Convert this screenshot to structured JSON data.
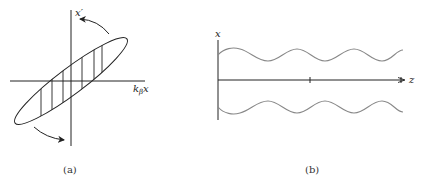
{
  "panel_a": {
    "caption": "(a)",
    "y_axis_label": "x′",
    "x_axis_label_main": "k",
    "x_axis_label_sub": "β",
    "x_axis_label_var": "x",
    "description": "Tilted phase-space ellipse with vertical hatching and rotation arrows"
  },
  "panel_b": {
    "caption": "(b)",
    "y_axis_label": "x",
    "x_axis_label": "z",
    "description": "Beam envelope oscillating along z (upper and lower sinusoidal envelopes)"
  },
  "colors": {
    "line": "#222222",
    "wave": "#888888",
    "background": "#ffffff"
  }
}
